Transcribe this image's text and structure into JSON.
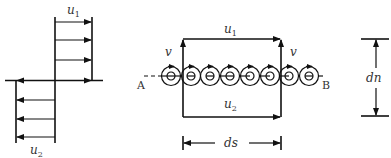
{
  "figure": {
    "velocity_profile": {
      "top_label": "u",
      "top_label_sub": "1",
      "bottom_label": "u",
      "bottom_label_sub": "2",
      "upper_arrows": 4,
      "lower_arrows": 4
    },
    "vortex_sheet": {
      "top_label": "u",
      "top_label_sub": "1",
      "bottom_label": "u",
      "bottom_label_sub": "2",
      "left_v_label": "v",
      "right_v_label": "v",
      "point_a": "A",
      "point_b": "B",
      "vortex_count": 8,
      "width_label": "ds"
    },
    "thickness": {
      "label": "dn"
    }
  }
}
